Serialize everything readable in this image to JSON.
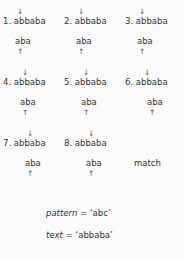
{
  "diagram": {
    "type": "naive-string-matching-steps",
    "background_color": "#fbfbfb",
    "text_color": "#333333",
    "arrow_color": "#555555",
    "down_arrow_glyph": "↓",
    "up_arrow_glyph": "↑",
    "columns": 3,
    "rows": 3,
    "steps": [
      {
        "number": "1.",
        "text": "abbaba",
        "pattern_window": "aba",
        "down_arrow": "↓",
        "up_arrow": "↑",
        "shift": 0,
        "match": false
      },
      {
        "number": "2.",
        "text": "abbaba",
        "pattern_window": "aba",
        "down_arrow": "↓",
        "up_arrow": "↑",
        "shift": 0,
        "match": false
      },
      {
        "number": "3.",
        "text": "abbaba",
        "pattern_window": "aba",
        "down_arrow": "↓",
        "up_arrow": "↑",
        "shift": 0,
        "match": false
      },
      {
        "number": "4.",
        "text": "abbaba",
        "pattern_window": "aba",
        "down_arrow": "↓",
        "up_arrow": "↑",
        "shift": 1,
        "match": false
      },
      {
        "number": "5.",
        "text": "abbaba",
        "pattern_window": "aba",
        "down_arrow": "↓",
        "up_arrow": "↑",
        "shift": 1,
        "match": false
      },
      {
        "number": "6.",
        "text": "abbaba",
        "pattern_window": "aba",
        "down_arrow": "↓",
        "up_arrow": "↑",
        "shift": 1,
        "match": false
      },
      {
        "number": "7.",
        "text": "abbaba",
        "pattern_window": "aba",
        "down_arrow": "↓",
        "up_arrow": "↑",
        "shift": 2,
        "match": false
      },
      {
        "number": "8.",
        "text": "abbaba",
        "pattern_window": "aba",
        "down_arrow": "↓",
        "up_arrow": "↑",
        "shift": 2,
        "match": false
      }
    ],
    "match_label": "match"
  },
  "legend": {
    "pattern_name": "pattern",
    "pattern_equals": " = ",
    "pattern_value": "‘abc’",
    "text_name": "text",
    "text_equals": " = ",
    "text_value": "‘abbaba’"
  }
}
